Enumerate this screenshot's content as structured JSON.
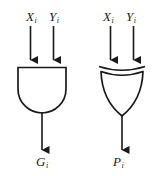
{
  "diagram": {
    "background_color": "#ffffff",
    "stroke_color": "#1a1a1a",
    "gates": [
      {
        "id": "and-gate",
        "type": "AND",
        "inputs": [
          {
            "name": "X",
            "subscript": "i"
          },
          {
            "name": "Y",
            "subscript": "i"
          }
        ],
        "output": {
          "name": "G",
          "subscript": "i"
        }
      },
      {
        "id": "xor-gate",
        "type": "XOR",
        "inputs": [
          {
            "name": "X",
            "subscript": "i"
          },
          {
            "name": "Y",
            "subscript": "i"
          }
        ],
        "output": {
          "name": "P",
          "subscript": "i"
        }
      }
    ]
  },
  "labels": {
    "left_input_x": "X",
    "left_input_x_sub": "i",
    "left_input_y": "Y",
    "left_input_y_sub": "i",
    "right_input_x": "X",
    "right_input_x_sub": "i",
    "right_input_y": "Y",
    "right_input_y_sub": "i",
    "left_output": "G",
    "left_output_sub": "i",
    "right_output": "P",
    "right_output_sub": "i"
  }
}
